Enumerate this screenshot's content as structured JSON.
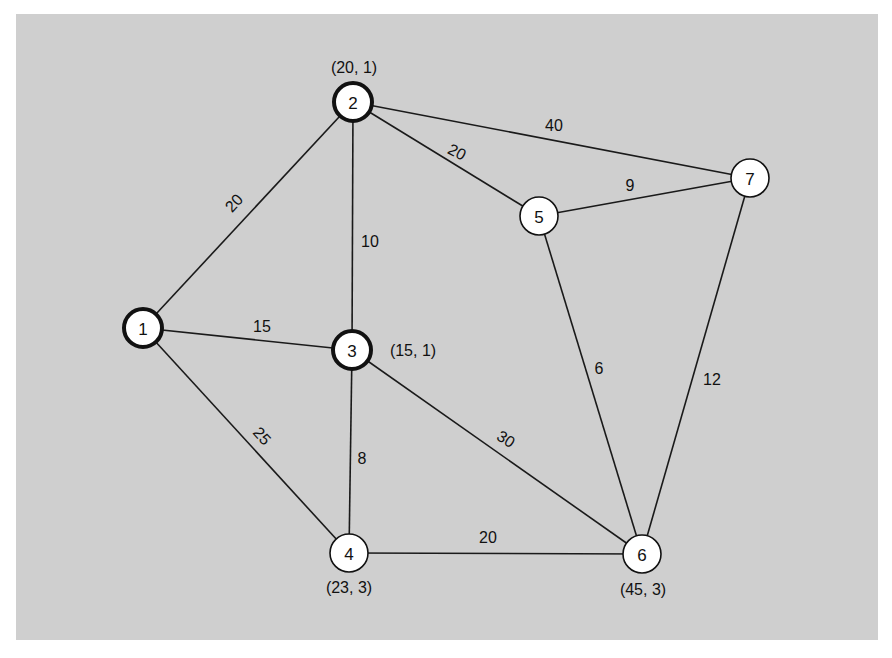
{
  "diagram": {
    "type": "weighted-undirected-graph",
    "background_color": "#cfcfcf",
    "panel": {
      "x": 16,
      "y": 14,
      "width": 862,
      "height": 626
    },
    "nodes": [
      {
        "id": "1",
        "label": "1",
        "x": 143,
        "y": 328,
        "r": 19,
        "highlighted": true,
        "annotation": null
      },
      {
        "id": "2",
        "label": "2",
        "x": 353,
        "y": 102,
        "r": 19,
        "highlighted": true,
        "annotation": {
          "text": "(20, 1)",
          "x": 354,
          "y": 67
        }
      },
      {
        "id": "3",
        "label": "3",
        "x": 352,
        "y": 350,
        "r": 19,
        "highlighted": true,
        "annotation": {
          "text": "(15, 1)",
          "x": 413,
          "y": 350
        }
      },
      {
        "id": "4",
        "label": "4",
        "x": 349,
        "y": 553,
        "r": 19,
        "highlighted": false,
        "annotation": {
          "text": "(23, 3)",
          "x": 349,
          "y": 587
        }
      },
      {
        "id": "5",
        "label": "5",
        "x": 539,
        "y": 216,
        "r": 19,
        "highlighted": false,
        "annotation": null
      },
      {
        "id": "6",
        "label": "6",
        "x": 642,
        "y": 554,
        "r": 19,
        "highlighted": false,
        "annotation": {
          "text": "(45, 3)",
          "x": 643,
          "y": 589
        }
      },
      {
        "id": "7",
        "label": "7",
        "x": 750,
        "y": 178,
        "r": 19,
        "highlighted": false,
        "annotation": null
      }
    ],
    "edges": [
      {
        "from": "1",
        "to": "2",
        "weight": "20",
        "lx": 234,
        "ly": 203,
        "rot": -47
      },
      {
        "from": "1",
        "to": "3",
        "weight": "15",
        "lx": 262,
        "ly": 326,
        "rot": 0
      },
      {
        "from": "1",
        "to": "4",
        "weight": "25",
        "lx": 262,
        "ly": 436,
        "rot": 48
      },
      {
        "from": "2",
        "to": "3",
        "weight": "10",
        "lx": 370,
        "ly": 241,
        "rot": 0
      },
      {
        "from": "2",
        "to": "5",
        "weight": "20",
        "lx": 457,
        "ly": 152,
        "rot": 28
      },
      {
        "from": "2",
        "to": "7",
        "weight": "40",
        "lx": 554,
        "ly": 125,
        "rot": 0
      },
      {
        "from": "3",
        "to": "4",
        "weight": "8",
        "lx": 362,
        "ly": 458,
        "rot": 0
      },
      {
        "from": "3",
        "to": "6",
        "weight": "30",
        "lx": 506,
        "ly": 439,
        "rot": 32
      },
      {
        "from": "4",
        "to": "6",
        "weight": "20",
        "lx": 488,
        "ly": 537,
        "rot": 0
      },
      {
        "from": "5",
        "to": "7",
        "weight": "9",
        "lx": 630,
        "ly": 185,
        "rot": 0
      },
      {
        "from": "5",
        "to": "6",
        "weight": "6",
        "lx": 599,
        "ly": 368,
        "rot": 0
      },
      {
        "from": "6",
        "to": "7",
        "weight": "12",
        "lx": 712,
        "ly": 379,
        "rot": 0
      }
    ]
  }
}
